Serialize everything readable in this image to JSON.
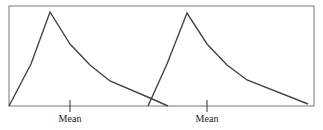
{
  "chart_data": {
    "type": "line",
    "title": "",
    "frame": {
      "left": 9,
      "top": 6,
      "right": 314,
      "bottom": 106
    },
    "series": [
      {
        "name": "distribution-1",
        "points": [
          [
            9,
            106
          ],
          [
            31,
            64
          ],
          [
            50,
            12
          ],
          [
            70,
            44
          ],
          [
            90,
            65
          ],
          [
            110,
            81
          ],
          [
            150,
            98
          ],
          [
            168,
            106
          ]
        ],
        "mean_x": 70
      },
      {
        "name": "distribution-2",
        "points": [
          [
            148,
            106
          ],
          [
            167,
            64
          ],
          [
            187,
            13
          ],
          [
            207,
            44
          ],
          [
            227,
            65
          ],
          [
            247,
            80
          ],
          [
            308,
            104
          ]
        ],
        "mean_x": 207
      }
    ],
    "labels": [
      {
        "text": "Mean",
        "x": 70
      },
      {
        "text": "Mean",
        "x": 207
      }
    ],
    "stroke_color": "#444444"
  }
}
